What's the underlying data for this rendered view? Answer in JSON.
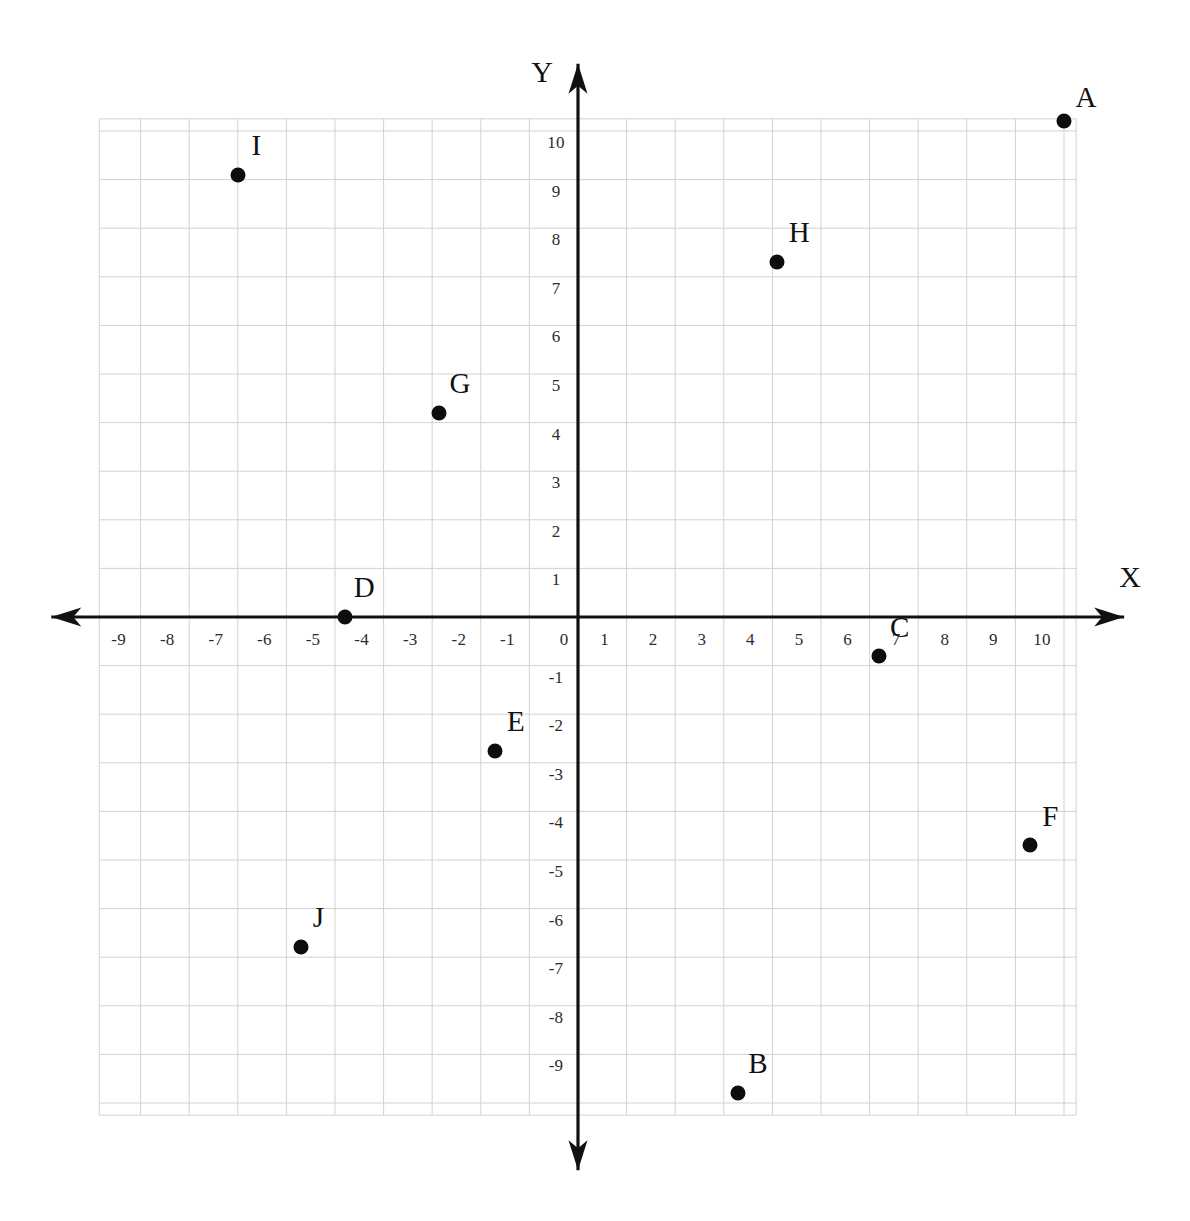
{
  "chart_data": {
    "type": "scatter",
    "title": "",
    "xlabel": "X",
    "ylabel": "Y",
    "xlim": [
      -9.85,
      10.25
    ],
    "ylim": [
      -10.25,
      10.25
    ],
    "grid": true,
    "grid_step": 1,
    "legend": "none",
    "axis_arrows": [
      "left",
      "right",
      "up",
      "down"
    ],
    "xticks": [
      -9,
      -8,
      -7,
      -6,
      -5,
      -4,
      -3,
      -2,
      -1,
      0,
      1,
      2,
      3,
      4,
      5,
      6,
      7,
      8,
      9,
      10
    ],
    "yticks": [
      10,
      9,
      8,
      7,
      6,
      5,
      4,
      3,
      2,
      1,
      -1,
      -2,
      -3,
      -4,
      -5,
      -6,
      -7,
      -8,
      -9
    ],
    "xtick_labels": [
      "-9",
      "-8",
      "-7",
      "-6",
      "-5",
      "-4",
      "-3",
      "-2",
      "-1",
      "0",
      "1",
      "2",
      "3",
      "4",
      "5",
      "6",
      "7",
      "8",
      "9",
      "10"
    ],
    "ytick_labels": [
      "10",
      "9",
      "8",
      "7",
      "6",
      "5",
      "4",
      "3",
      "2",
      "1",
      "-1",
      "-2",
      "-3",
      "-4",
      "-5",
      "-6",
      "-7",
      "-8",
      "-9"
    ],
    "points": [
      {
        "label": "A",
        "x": 10.0,
        "y": 10.2,
        "label_dx": 0.45,
        "label_dy": 0.5
      },
      {
        "label": "B",
        "x": 3.3,
        "y": -9.8,
        "label_dx": 0.4,
        "label_dy": 0.62
      },
      {
        "label": "C",
        "x": 6.2,
        "y": -0.8,
        "label_dx": 0.42,
        "label_dy": 0.6
      },
      {
        "label": "D",
        "x": -4.8,
        "y": 0.0,
        "label_dx": 0.4,
        "label_dy": 0.62
      },
      {
        "label": "E",
        "x": -1.7,
        "y": -2.75,
        "label_dx": 0.42,
        "label_dy": 0.62
      },
      {
        "label": "F",
        "x": 9.3,
        "y": -4.7,
        "label_dx": 0.42,
        "label_dy": 0.6
      },
      {
        "label": "G",
        "x": -2.85,
        "y": 4.2,
        "label_dx": 0.42,
        "label_dy": 0.62
      },
      {
        "label": "H",
        "x": 4.1,
        "y": 7.3,
        "label_dx": 0.45,
        "label_dy": 0.62
      },
      {
        "label": "I",
        "x": -7.0,
        "y": 9.1,
        "label_dx": 0.38,
        "label_dy": 0.62
      },
      {
        "label": "J",
        "x": -5.7,
        "y": -6.8,
        "label_dx": 0.36,
        "label_dy": 0.62
      }
    ],
    "colors": {
      "point": "#0d0d0d",
      "axis": "#111111",
      "grid": "#d2d2d6",
      "tick_text": "#2b2b2b",
      "background": "#ffffff"
    }
  },
  "axis_labels": {
    "x": "X",
    "y": "Y"
  }
}
